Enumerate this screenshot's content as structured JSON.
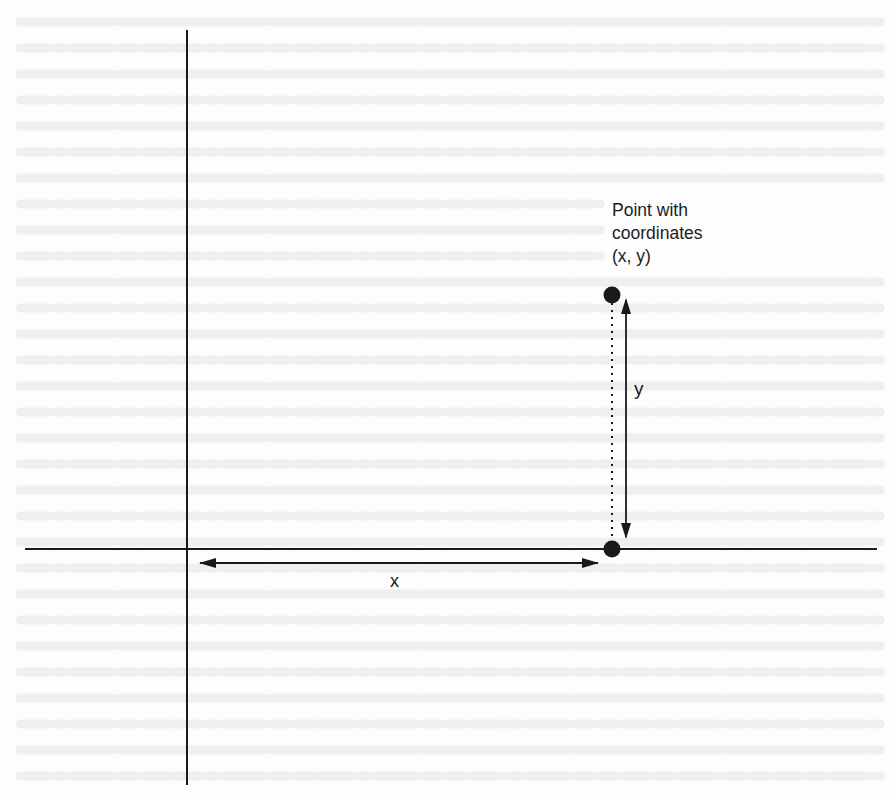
{
  "figure": {
    "annotation": {
      "lines": [
        "Point with",
        "coordinates",
        "(x, y)"
      ]
    },
    "x_measure_label": "x",
    "y_measure_label": "y"
  },
  "colors": {
    "ink": "#1a1a1a",
    "paper": "#fdfdfd",
    "ghost_text": "#ececec"
  }
}
